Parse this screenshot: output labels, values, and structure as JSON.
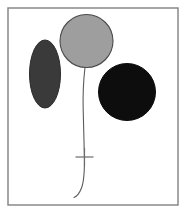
{
  "figure": {
    "title": "Balloon with string and two filled shapes",
    "type": "line-drawing",
    "canvas": {
      "width": 188,
      "height": 217,
      "background": "#ffffff"
    },
    "frame": {
      "name": "figure-border",
      "x": 8,
      "y": 8,
      "width": 170,
      "height": 197,
      "stroke": "#808080",
      "stroke_width": 1.4,
      "fill": "none"
    },
    "shapes": [
      {
        "id": "balloon",
        "label": "Gray balloon circle",
        "kind": "circle",
        "cx": 86.5,
        "cy": 41,
        "r": 26.5,
        "fill": "#9e9e9e",
        "stroke": "#4a4a4a",
        "stroke_width": 1.1
      },
      {
        "id": "left-ellipse",
        "label": "Dark gray ellipse",
        "kind": "ellipse",
        "cx": 45,
        "cy": 74,
        "rx": 15.5,
        "ry": 34,
        "fill": "#3a3a3a",
        "stroke": "#2b2b2b",
        "stroke_width": 1
      },
      {
        "id": "right-circle",
        "label": "Black circle",
        "kind": "circle",
        "cx": 127,
        "cy": 92,
        "r": 28.5,
        "fill": "#0d0d0d",
        "stroke": "#0d0d0d",
        "stroke_width": 1
      }
    ],
    "string": {
      "id": "balloon-string",
      "label": "Balloon string",
      "kind": "path",
      "d": "M 85 67.5 C 83.5 80 82.8 95 83.2 110 C 83.6 126 84.1 142 84.4 157 C 84.6 170 84.2 181 81.5 188 C 79.2 194 76.4 196.5 74 197.5",
      "stroke": "#5a5a5a",
      "stroke_width": 1.1,
      "fill": "none"
    },
    "marker": {
      "id": "string-cross",
      "label": "Cross marker on string",
      "kind": "cross",
      "cx": 84.5,
      "cy": 157,
      "arm": 9,
      "stroke": "#6b6b6b",
      "stroke_width": 1.2
    }
  }
}
